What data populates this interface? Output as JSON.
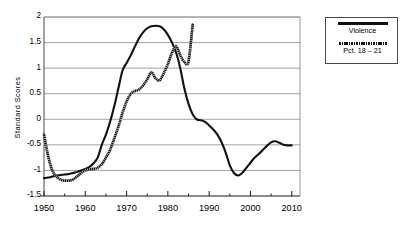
{
  "chart_data": {
    "type": "line",
    "title": "",
    "xlabel": "",
    "ylabel": "Standard Scores",
    "xlim": [
      1950,
      2012
    ],
    "ylim": [
      -1.5,
      2
    ],
    "grid": true,
    "grid_axis": "y",
    "legend_position": "right-outside",
    "ytick_labels": [
      "2",
      "1.5",
      "1",
      "0.5",
      "0",
      "-0.5",
      "-1",
      "-1.5"
    ],
    "ytick_values": [
      2,
      1.5,
      1,
      0.5,
      0,
      -0.5,
      -1,
      -1.5
    ],
    "xtick_labels": [
      "1950",
      "1960",
      "1970",
      "1980",
      "1990",
      "2000",
      "2010"
    ],
    "xtick_values": [
      1950,
      1960,
      1970,
      1980,
      1990,
      2000,
      2010
    ],
    "xminor_values": [
      1955,
      1965,
      1975,
      1985,
      1995,
      2005
    ],
    "series": [
      {
        "name": "Violence",
        "style": "solid",
        "color": "#111111",
        "x": [
          1950,
          1951,
          1952,
          1953,
          1954,
          1955,
          1956,
          1957,
          1958,
          1959,
          1960,
          1961,
          1962,
          1963,
          1964,
          1965,
          1966,
          1967,
          1968,
          1969,
          1970,
          1971,
          1972,
          1973,
          1974,
          1975,
          1976,
          1977,
          1978,
          1979,
          1980,
          1981,
          1982,
          1983,
          1984,
          1985,
          1986,
          1987,
          1988,
          1989,
          1990,
          1991,
          1992,
          1993,
          1994,
          1995,
          1996,
          1997,
          1998,
          1999,
          2000,
          2001,
          2002,
          2003,
          2004,
          2005,
          2006,
          2007,
          2008,
          2009,
          2010
        ],
        "y": [
          -1.15,
          -1.14,
          -1.12,
          -1.1,
          -1.09,
          -1.08,
          -1.07,
          -1.05,
          -1.03,
          -1.0,
          -0.97,
          -0.93,
          -0.86,
          -0.75,
          -0.5,
          -0.3,
          -0.05,
          0.25,
          0.6,
          0.95,
          1.1,
          1.25,
          1.42,
          1.58,
          1.7,
          1.78,
          1.82,
          1.83,
          1.82,
          1.76,
          1.65,
          1.5,
          1.3,
          1.0,
          0.6,
          0.3,
          0.1,
          0.0,
          -0.02,
          -0.05,
          -0.12,
          -0.2,
          -0.3,
          -0.45,
          -0.65,
          -0.9,
          -1.05,
          -1.1,
          -1.05,
          -0.95,
          -0.85,
          -0.75,
          -0.68,
          -0.6,
          -0.52,
          -0.45,
          -0.43,
          -0.46,
          -0.5,
          -0.51,
          -0.51
        ]
      },
      {
        "name": "Pct. 18 – 21",
        "style": "dotted",
        "color": "#111111",
        "x": [
          1950,
          1951,
          1952,
          1953,
          1954,
          1955,
          1956,
          1957,
          1958,
          1959,
          1960,
          1961,
          1962,
          1963,
          1964,
          1965,
          1966,
          1967,
          1968,
          1969,
          1970,
          1971,
          1972,
          1973,
          1974,
          1975,
          1976,
          1977,
          1978,
          1979,
          1980,
          1981,
          1982,
          1983,
          1984,
          1985,
          1986
        ],
        "y": [
          -0.3,
          -0.72,
          -1.0,
          -1.12,
          -1.18,
          -1.2,
          -1.2,
          -1.18,
          -1.12,
          -1.05,
          -1.0,
          -0.98,
          -0.97,
          -0.95,
          -0.88,
          -0.75,
          -0.6,
          -0.38,
          -0.15,
          0.12,
          0.35,
          0.5,
          0.55,
          0.58,
          0.66,
          0.78,
          0.92,
          0.8,
          0.76,
          0.9,
          1.08,
          1.3,
          1.43,
          1.25,
          1.12,
          1.13,
          1.85
        ]
      }
    ]
  },
  "legend": {
    "entries": [
      {
        "label": "Violence",
        "swatch": "solid-line-swatch"
      },
      {
        "label": "Pct. 18 – 21",
        "swatch": "dotted-line-swatch"
      }
    ]
  }
}
